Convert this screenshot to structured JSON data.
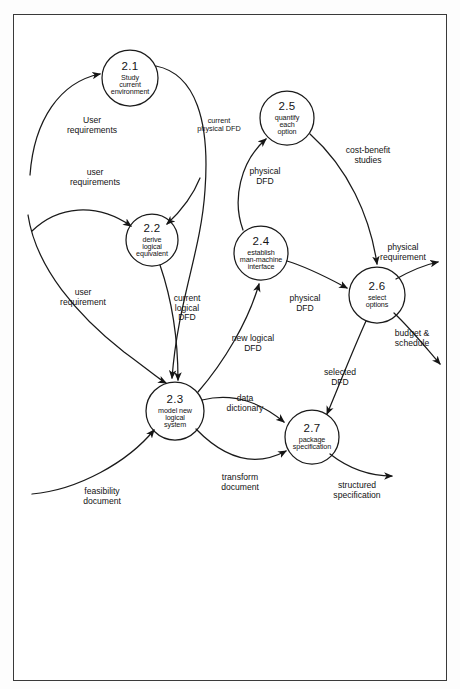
{
  "diagram": {
    "frame_color": "#3a3a3a",
    "line_color": "#1a1a1a",
    "text_color": "#141414",
    "processes": [
      {
        "id": "2.1",
        "number": "2.1",
        "lines": [
          "Study",
          "current",
          "environment"
        ],
        "cx": 130,
        "cy": 78,
        "r": 28
      },
      {
        "id": "2.2",
        "number": "2.2",
        "lines": [
          "derive",
          "logical",
          "equivalent"
        ],
        "cx": 152,
        "cy": 240,
        "r": 26
      },
      {
        "id": "2.3",
        "number": "2.3",
        "lines": [
          "model  new",
          "logical",
          "system"
        ],
        "cx": 175,
        "cy": 411,
        "r": 29
      },
      {
        "id": "2.4",
        "number": "2.4",
        "lines": [
          "establish",
          "man-machine",
          "interface"
        ],
        "cx": 261,
        "cy": 253,
        "r": 27
      },
      {
        "id": "2.5",
        "number": "2.5",
        "lines": [
          "quantify",
          "each",
          "option"
        ],
        "cx": 287,
        "cy": 118,
        "r": 27
      },
      {
        "id": "2.6",
        "number": "2.6",
        "lines": [
          "select",
          "options"
        ],
        "cx": 377,
        "cy": 295,
        "r": 28
      },
      {
        "id": "2.7",
        "number": "2.7",
        "lines": [
          "package",
          "specification"
        ],
        "cx": 312,
        "cy": 437,
        "r": 27
      }
    ],
    "flows": [
      {
        "id": "user-requirements-upper",
        "lines": [
          "User",
          "requirements"
        ],
        "x": 92,
        "y": 126,
        "size": "normal"
      },
      {
        "id": "user-requirements-lower",
        "lines": [
          "user",
          "requirements"
        ],
        "x": 95,
        "y": 178,
        "size": "normal"
      },
      {
        "id": "current-physical-dfd",
        "lines": [
          "current",
          "physical DFD"
        ],
        "x": 219,
        "y": 125,
        "size": "small"
      },
      {
        "id": "physical-dfd-to-25",
        "lines": [
          "physical",
          "DFD"
        ],
        "x": 265,
        "y": 177,
        "size": "normal"
      },
      {
        "id": "cost-benefit-studies",
        "lines": [
          "cost-benefit",
          "studies",
          ""
        ],
        "x": 368,
        "y": 156,
        "size": "normal"
      },
      {
        "id": "user-requirement",
        "lines": [
          "user",
          "requirement"
        ],
        "x": 83,
        "y": 298,
        "size": "normal"
      },
      {
        "id": "current-logical-dfd",
        "lines": [
          "current",
          "logical",
          "DFD"
        ],
        "x": 187,
        "y": 308,
        "size": "normal"
      },
      {
        "id": "physical-dfd-to-26",
        "lines": [
          "physical",
          "DFD"
        ],
        "x": 305,
        "y": 304,
        "size": "normal"
      },
      {
        "id": "physical-requirement",
        "lines": [
          "physical",
          "requirement"
        ],
        "x": 403,
        "y": 253,
        "size": "normal"
      },
      {
        "id": "new-logical-dfd",
        "lines": [
          "new  logical",
          "DFD"
        ],
        "x": 253,
        "y": 344,
        "size": "normal"
      },
      {
        "id": "budget-schedule",
        "lines": [
          "budget &",
          "schedule"
        ],
        "x": 412,
        "y": 339,
        "size": "normal"
      },
      {
        "id": "selected-dfd",
        "lines": [
          "selected",
          "DFD"
        ],
        "x": 340,
        "y": 378,
        "size": "normal"
      },
      {
        "id": "data-dictionary",
        "lines": [
          "data",
          "dictionary"
        ],
        "x": 245,
        "y": 404,
        "size": "normal"
      },
      {
        "id": "transform-document",
        "lines": [
          "transform",
          "document"
        ],
        "x": 240,
        "y": 483,
        "size": "normal"
      },
      {
        "id": "feasibility-document",
        "lines": [
          "feasibility",
          "document"
        ],
        "x": 102,
        "y": 497,
        "size": "normal"
      },
      {
        "id": "structured-specification",
        "lines": [
          "structured",
          "specification"
        ],
        "x": 357,
        "y": 491,
        "size": "normal"
      }
    ]
  }
}
